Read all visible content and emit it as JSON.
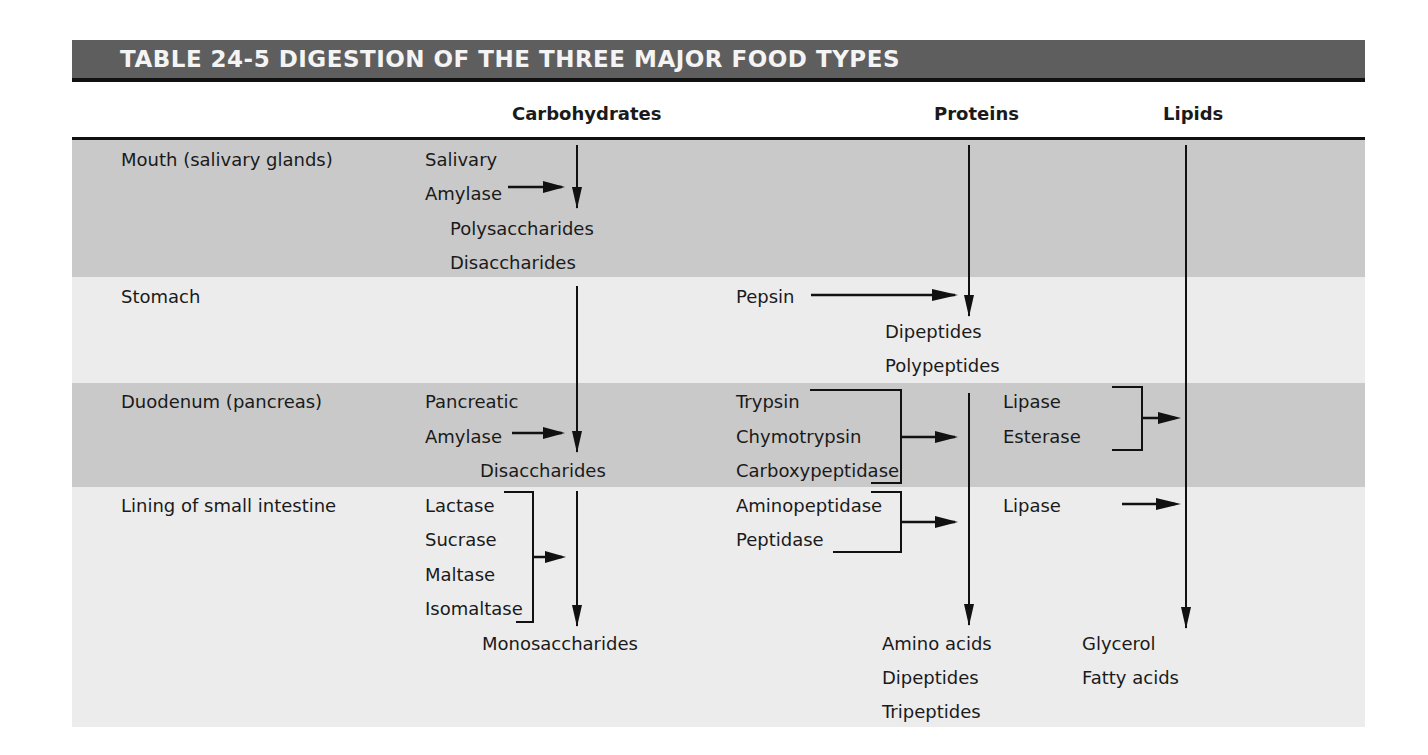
{
  "title": "TABLE 24-5 DIGESTION OF THE THREE MAJOR FOOD TYPES",
  "columns": {
    "carbohydrates": "Carbohydrates",
    "proteins": "Proteins",
    "lipids": "Lipids"
  },
  "rows": [
    {
      "site": "Mouth (salivary glands)",
      "carbohydrates": {
        "enzymes": [
          "Salivary",
          "Amylase"
        ],
        "products": [
          "Polysaccharides",
          "Disaccharides"
        ]
      },
      "proteins": {
        "enzymes": [],
        "products": []
      },
      "lipids": {
        "enzymes": [],
        "products": []
      }
    },
    {
      "site": "Stomach",
      "carbohydrates": {
        "enzymes": [],
        "products": []
      },
      "proteins": {
        "enzymes": [
          "Pepsin"
        ],
        "products": [
          "Dipeptides",
          "Polypeptides"
        ]
      },
      "lipids": {
        "enzymes": [],
        "products": []
      }
    },
    {
      "site": "Duodenum (pancreas)",
      "carbohydrates": {
        "enzymes": [
          "Pancreatic",
          "Amylase"
        ],
        "products": [
          "Disaccharides"
        ]
      },
      "proteins": {
        "enzymes": [
          "Trypsin",
          "Chymotrypsin",
          "Carboxypeptidase"
        ],
        "products": []
      },
      "lipids": {
        "enzymes": [
          "Lipase",
          "Esterase"
        ],
        "products": []
      }
    },
    {
      "site": "Lining of small intestine",
      "carbohydrates": {
        "enzymes": [
          "Lactase",
          "Sucrase",
          "Maltase",
          "Isomaltase"
        ],
        "products": [
          "Monosaccharides"
        ]
      },
      "proteins": {
        "enzymes": [
          "Aminopeptidase",
          "Peptidase"
        ],
        "products": [
          "Amino acids",
          "Dipeptides",
          "Tripeptides"
        ]
      },
      "lipids": {
        "enzymes": [
          "Lipase"
        ],
        "products": [
          "Glycerol",
          "Fatty acids"
        ]
      }
    }
  ],
  "colors": {
    "title_bar": "#5e5e5e",
    "title_text": "#f4f4f4",
    "band_dark": "#c9c9c9",
    "band_light": "#ececec",
    "ink": "#1a1a1a"
  }
}
